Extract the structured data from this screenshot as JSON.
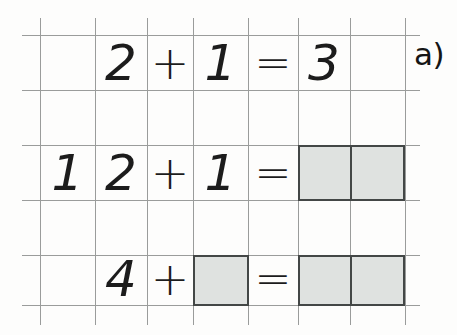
{
  "worksheet": {
    "exercise_label": "a)",
    "background_color": "#fdfdfc",
    "grid_line_color": "#9a9c9b",
    "ink_color": "#1c1c1c",
    "shaded_fill_color": "#dfe2e0",
    "shaded_border_color": "#434746",
    "grid": {
      "columns": 7,
      "rows": 5,
      "vertical_line_x": [
        40,
        95,
        147,
        193,
        248,
        298,
        350,
        405
      ],
      "horizontal_line_y": [
        35,
        90,
        145,
        200,
        255,
        305
      ],
      "cell_width": 52,
      "cell_height": 55
    },
    "problems": [
      {
        "index": 1,
        "row": 1,
        "expression": "2 + 1 = 3",
        "solved": true,
        "cells": [
          {
            "col": 2,
            "text": "2",
            "kind": "digit"
          },
          {
            "col": 3,
            "text": "+",
            "kind": "operator"
          },
          {
            "col": 4,
            "text": "1",
            "kind": "digit"
          },
          {
            "col": 5,
            "text": "=",
            "kind": "operator"
          },
          {
            "col": 6,
            "text": "3",
            "kind": "digit"
          }
        ],
        "blanks": []
      },
      {
        "index": 2,
        "row": 3,
        "expression": "12 + 1 =",
        "solved": false,
        "cells": [
          {
            "col": 1,
            "text": "1",
            "kind": "digit"
          },
          {
            "col": 2,
            "text": "2",
            "kind": "digit"
          },
          {
            "col": 3,
            "text": "+",
            "kind": "operator"
          },
          {
            "col": 4,
            "text": "1",
            "kind": "digit"
          },
          {
            "col": 5,
            "text": "=",
            "kind": "operator"
          }
        ],
        "blanks": [
          {
            "start_col": 6,
            "span": 2,
            "label": "answer-box"
          }
        ]
      },
      {
        "index": 3,
        "row": 5,
        "expression": "4 + _ = _",
        "solved": false,
        "cells": [
          {
            "col": 2,
            "text": "4",
            "kind": "digit"
          },
          {
            "col": 3,
            "text": "+",
            "kind": "operator"
          },
          {
            "col": 5,
            "text": "=",
            "kind": "operator"
          }
        ],
        "blanks": [
          {
            "start_col": 4,
            "span": 1,
            "label": "addend-box"
          },
          {
            "start_col": 6,
            "span": 2,
            "label": "answer-box"
          }
        ]
      }
    ]
  }
}
